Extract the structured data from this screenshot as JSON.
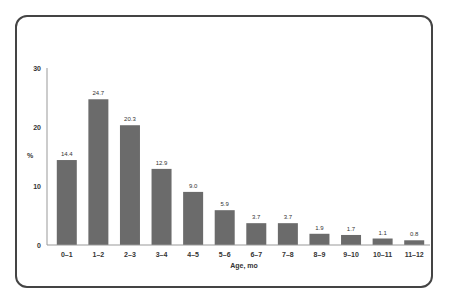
{
  "chart_data": {
    "type": "bar",
    "title": "",
    "xlabel": "Age, mo",
    "ylabel": "%",
    "ylim": [
      0,
      30
    ],
    "yticks": [
      0,
      10,
      20,
      30
    ],
    "grid": false,
    "legend": null,
    "categories": [
      "0–1",
      "1–2",
      "2–3",
      "3–4",
      "4–5",
      "5–6",
      "6–7",
      "7–8",
      "8–9",
      "9–10",
      "10–11",
      "11–12"
    ],
    "values": [
      14.4,
      24.7,
      20.3,
      12.9,
      9.0,
      5.9,
      3.7,
      3.7,
      1.9,
      1.7,
      1.1,
      0.8
    ],
    "value_labels": [
      "14.4",
      "24.7",
      "20.3",
      "12.9",
      "9.0",
      "5.9",
      "3.7",
      "3.7",
      "1.9",
      "1.7",
      "1.1",
      "0.8"
    ],
    "bar_color": "#6b6b6b"
  }
}
